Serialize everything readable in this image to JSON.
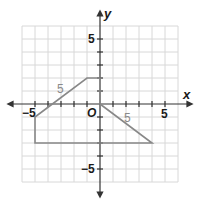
{
  "diagram": {
    "type": "coordinate-plane",
    "grid": {
      "min": -6,
      "max": 6,
      "cell_px": 13,
      "color": "#d8d8d8"
    },
    "origin_px": {
      "x": 100,
      "y": 104
    },
    "axes": {
      "x_label": "x",
      "y_label": "y",
      "origin_label": "O",
      "color": "#333333"
    },
    "tick_labels": {
      "x_neg": "−5",
      "x_pos": "5",
      "y_pos": "5",
      "y_neg": "−5"
    },
    "polygon": {
      "color": "#888888",
      "vertices": [
        [
          0,
          2
        ],
        [
          -1,
          2
        ],
        [
          -5,
          -1
        ],
        [
          -5,
          -3
        ],
        [
          4,
          -3
        ],
        [
          0,
          0
        ]
      ]
    },
    "side_labels": [
      {
        "text": "5",
        "segment": "(-1,2)-(-5,-1)"
      },
      {
        "text": "5",
        "segment": "(0,0)-(4,-3)"
      }
    ]
  }
}
